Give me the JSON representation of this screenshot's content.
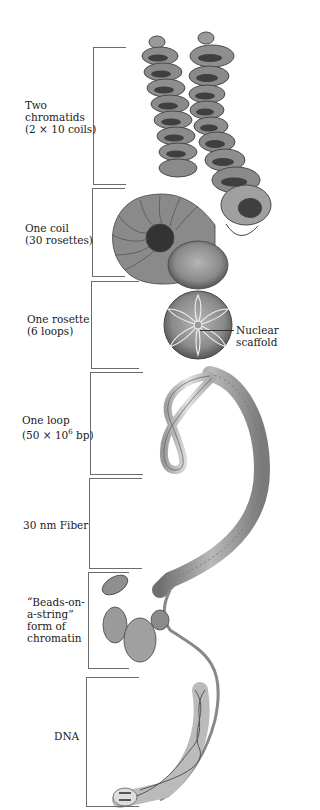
{
  "figure": {
    "levels": [
      {
        "id": "two-chromatids",
        "lines": [
          "Two",
          "chromatids",
          "(2 × 10 coils)"
        ]
      },
      {
        "id": "one-coil",
        "lines": [
          "One coil",
          "(30 rosettes)"
        ]
      },
      {
        "id": "one-rosette",
        "lines": [
          "One rosette",
          "(6 loops)"
        ]
      },
      {
        "id": "one-loop",
        "lines": [
          "One loop",
          "(50 × 10",
          "6",
          " bp)"
        ]
      },
      {
        "id": "fiber-30nm",
        "lines": [
          "30 nm Fiber"
        ]
      },
      {
        "id": "beads-on-a-string",
        "lines": [
          "“Beads-on-",
          "a-string”",
          "form of",
          "chromatin"
        ]
      },
      {
        "id": "dna",
        "lines": [
          "DNA"
        ]
      }
    ],
    "callout": {
      "lines": [
        "Nuclear",
        "scaffold"
      ]
    }
  },
  "colors": {
    "ink": "#1a1a1a",
    "bracket": "#6b6b6b",
    "shade_dark": "#555555",
    "shade_mid": "#8c8c8c",
    "shade_light": "#c8c8c8"
  }
}
